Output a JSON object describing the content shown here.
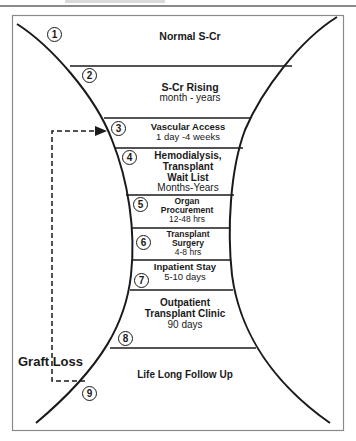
{
  "header": {
    "caption": ""
  },
  "diagram": {
    "stages": [
      {
        "number": "1",
        "title": "Normal S-Cr",
        "duration": ""
      },
      {
        "number": "2",
        "title": "S-Cr Rising",
        "duration": "month - years"
      },
      {
        "number": "3",
        "title": "Vascular Access",
        "duration": "1 day -4 weeks"
      },
      {
        "number": "4",
        "title": "Hemodialysis, Transplant Wait List",
        "title_lines": [
          "Hemodialysis,",
          "Transplant",
          "Wait List"
        ],
        "duration": "Months-Years"
      },
      {
        "number": "5",
        "title": "Organ Procurement",
        "title_lines": [
          "Organ",
          "Procurement"
        ],
        "duration": "12-48 hrs"
      },
      {
        "number": "6",
        "title": "Transplant Surgery",
        "title_lines": [
          "Transplant",
          "Surgery"
        ],
        "duration": "4-8 hrs"
      },
      {
        "number": "7",
        "title": "Inpatient Stay",
        "duration": "5-10 days"
      },
      {
        "number": "8",
        "title": "Outpatient Transplant Clinic",
        "title_lines": [
          "Outpatient",
          "Transplant Clinic"
        ],
        "duration": "90 days"
      },
      {
        "number": "9",
        "title": "Life Long Follow Up",
        "duration": ""
      }
    ],
    "feedback_arrow": {
      "label": "Graft Loss",
      "from_stage": "9",
      "to_stage": "3"
    },
    "colors": {
      "ink": "#1a1a1a",
      "border": "#8a8a8a",
      "background": "#ffffff"
    }
  }
}
